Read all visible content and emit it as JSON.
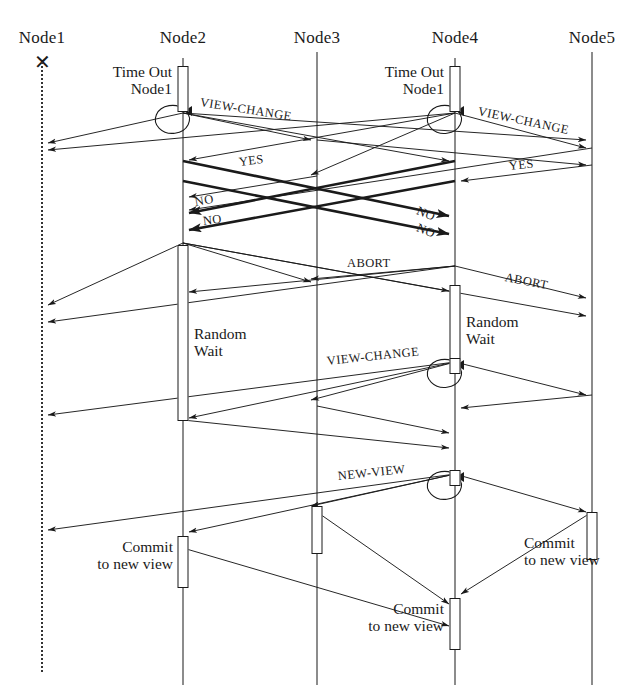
{
  "diagram": {
    "type": "sequence-diagram",
    "width": 625,
    "height": 696,
    "background": "#ffffff",
    "line_color": "#1a1a1a"
  },
  "nodes": [
    {
      "id": "n1",
      "label": "Node1",
      "x": 42,
      "label_y": 28,
      "lifeline_top": 62,
      "lifeline_bottom": 672,
      "state": "failed",
      "dead_marker": "x-mark",
      "dead_marker_y": 62
    },
    {
      "id": "n2",
      "label": "Node2",
      "x": 183,
      "label_y": 28,
      "lifeline_top": 58,
      "lifeline_bottom": 685,
      "state": "alive"
    },
    {
      "id": "n3",
      "label": "Node3",
      "x": 317,
      "label_y": 28,
      "lifeline_top": 52,
      "lifeline_bottom": 685,
      "state": "alive"
    },
    {
      "id": "n4",
      "label": "Node4",
      "x": 455,
      "label_y": 28,
      "lifeline_top": 58,
      "lifeline_bottom": 685,
      "state": "alive"
    },
    {
      "id": "n5",
      "label": "Node5",
      "x": 592,
      "label_y": 28,
      "lifeline_top": 52,
      "lifeline_bottom": 685,
      "state": "alive"
    }
  ],
  "activations": [
    {
      "node": "n2",
      "y": 66,
      "h": 46,
      "w": 11,
      "name": "timeout-box-node2"
    },
    {
      "node": "n4",
      "y": 66,
      "h": 46,
      "w": 11,
      "name": "timeout-box-node4"
    },
    {
      "node": "n2",
      "y": 245,
      "h": 176,
      "w": 11,
      "name": "random-wait-box-node2"
    },
    {
      "node": "n4",
      "y": 285,
      "h": 76,
      "w": 11,
      "name": "random-wait-box-node4"
    },
    {
      "node": "n4",
      "y": 358,
      "h": 16,
      "w": 11,
      "name": "view-change-box-node4"
    },
    {
      "node": "n4",
      "y": 470,
      "h": 16,
      "w": 11,
      "name": "new-view-box-node4"
    },
    {
      "node": "n3",
      "y": 506,
      "h": 48,
      "w": 11,
      "name": "commit-box-node3-upper"
    },
    {
      "node": "n5",
      "y": 512,
      "h": 48,
      "w": 11,
      "name": "commit-box-node5"
    },
    {
      "node": "n2",
      "y": 536,
      "h": 52,
      "w": 11,
      "name": "commit-box-node2"
    },
    {
      "node": "n4",
      "y": 598,
      "h": 52,
      "w": 11,
      "name": "commit-box-node4"
    }
  ],
  "notes": [
    {
      "text_line1": "Time Out",
      "text_line2": "Node1",
      "x": 172,
      "y": 63,
      "align": "right",
      "name": "note-timeout-node2"
    },
    {
      "text_line1": "Time Out",
      "text_line2": "Node1",
      "x": 444,
      "y": 63,
      "align": "right",
      "name": "note-timeout-node4"
    },
    {
      "text_line1": "Random",
      "text_line2": "Wait",
      "x": 194,
      "y": 325,
      "align": "left",
      "name": "note-random-wait-node2"
    },
    {
      "text_line1": "Random",
      "text_line2": "Wait",
      "x": 466,
      "y": 313,
      "align": "left",
      "name": "note-random-wait-node4"
    },
    {
      "text_line1": "Commit",
      "text_line2": "to new view",
      "x": 173,
      "y": 538,
      "align": "right",
      "name": "note-commit-node2"
    },
    {
      "text_line1": "Commit",
      "text_line2": "to new view",
      "x": 524,
      "y": 534,
      "align": "left",
      "name": "note-commit-node5"
    },
    {
      "text_line1": "Commit",
      "text_line2": "to new view",
      "x": 444,
      "y": 600,
      "align": "right",
      "name": "note-commit-node4"
    }
  ],
  "message_labels": [
    {
      "text": "VIEW-CHANGE",
      "x": 200,
      "y": 95,
      "rotate": 9,
      "size": "normal",
      "name": "label-view-change-1"
    },
    {
      "text": "VIEW-CHANGE",
      "x": 478,
      "y": 104,
      "rotate": 12,
      "size": "normal",
      "name": "label-view-change-2"
    },
    {
      "text": "YES",
      "x": 239,
      "y": 155,
      "rotate": -7,
      "size": "normal",
      "name": "label-yes-1"
    },
    {
      "text": "YES",
      "x": 509,
      "y": 159,
      "rotate": -6,
      "size": "normal",
      "name": "label-yes-2"
    },
    {
      "text": "NO",
      "x": 195,
      "y": 195,
      "rotate": -10,
      "size": "normal",
      "name": "label-no-1"
    },
    {
      "text": "NO",
      "x": 203,
      "y": 214,
      "rotate": -7,
      "size": "normal",
      "name": "label-no-2"
    },
    {
      "text": "NO",
      "x": 417,
      "y": 203,
      "rotate": 22,
      "size": "normal",
      "name": "label-no-3"
    },
    {
      "text": "NO",
      "x": 417,
      "y": 220,
      "rotate": 22,
      "size": "normal",
      "name": "label-no-4"
    },
    {
      "text": "ABORT",
      "x": 347,
      "y": 256,
      "rotate": 0,
      "size": "normal",
      "name": "label-abort-1"
    },
    {
      "text": "ABORT",
      "x": 505,
      "y": 270,
      "rotate": 11,
      "size": "normal",
      "name": "label-abort-2"
    },
    {
      "text": "VIEW-CHANGE",
      "x": 327,
      "y": 354,
      "rotate": -6,
      "size": "normal",
      "name": "label-view-change-3"
    },
    {
      "text": "NEW-VIEW",
      "x": 338,
      "y": 469,
      "rotate": -6,
      "size": "normal",
      "name": "label-new-view"
    }
  ],
  "self_loops": [
    {
      "x": 183,
      "y": 124,
      "rx": 17,
      "ry": 14,
      "name": "self-loop-node2-viewchange"
    },
    {
      "x": 455,
      "y": 124,
      "rx": 17,
      "ry": 14,
      "name": "self-loop-node4-viewchange"
    },
    {
      "x": 455,
      "y": 378,
      "rx": 17,
      "ry": 14,
      "name": "self-loop-node4-viewchange2"
    },
    {
      "x": 455,
      "y": 490,
      "rx": 17,
      "ry": 14,
      "name": "self-loop-node4-newview"
    }
  ],
  "arrows": [
    {
      "x1": 183,
      "y1": 113,
      "x2": 48,
      "y2": 143,
      "w": "thin",
      "name": "arrow-view-change-n2-n1"
    },
    {
      "x1": 183,
      "y1": 113,
      "x2": 311,
      "y2": 140,
      "w": "thin",
      "name": "arrow-view-change-n2-n3"
    },
    {
      "x1": 183,
      "y1": 113,
      "x2": 449,
      "y2": 161,
      "w": "thin",
      "name": "arrow-view-change-n2-n4"
    },
    {
      "x1": 183,
      "y1": 113,
      "x2": 586,
      "y2": 140,
      "w": "thin",
      "name": "arrow-view-change-n2-n5"
    },
    {
      "x1": 455,
      "y1": 113,
      "x2": 48,
      "y2": 150,
      "w": "thin",
      "name": "arrow-view-change-n4-n1"
    },
    {
      "x1": 455,
      "y1": 113,
      "x2": 189,
      "y2": 160,
      "w": "thin",
      "name": "arrow-view-change-n4-n2"
    },
    {
      "x1": 455,
      "y1": 113,
      "x2": 311,
      "y2": 175,
      "w": "thin",
      "name": "arrow-view-change-n4-n3"
    },
    {
      "x1": 455,
      "y1": 113,
      "x2": 586,
      "y2": 148,
      "w": "thin",
      "name": "arrow-view-change-n4-n5"
    },
    {
      "x1": 317,
      "y1": 176,
      "x2": 189,
      "y2": 197,
      "w": "thin",
      "name": "arrow-yes-n3-n2"
    },
    {
      "x1": 592,
      "y1": 148,
      "x2": 189,
      "y2": 210,
      "w": "thin",
      "name": "arrow-yes-n5-n2"
    },
    {
      "x1": 317,
      "y1": 140,
      "x2": 586,
      "y2": 165,
      "w": "thin",
      "name": "arrow-yes-n3-n5"
    },
    {
      "x1": 592,
      "y1": 165,
      "x2": 461,
      "y2": 181,
      "w": "thin",
      "name": "arrow-yes-n5-n4"
    },
    {
      "x1": 455,
      "y1": 161,
      "x2": 189,
      "y2": 213,
      "w": "bold",
      "name": "arrow-no-n4-n2"
    },
    {
      "x1": 455,
      "y1": 181,
      "x2": 189,
      "y2": 230,
      "w": "bold",
      "name": "arrow-no2-n4-n2"
    },
    {
      "x1": 183,
      "y1": 161,
      "x2": 449,
      "y2": 216,
      "w": "bold",
      "name": "arrow-no-n2-n4"
    },
    {
      "x1": 183,
      "y1": 181,
      "x2": 449,
      "y2": 234,
      "w": "bold",
      "name": "arrow-no2-n2-n4"
    },
    {
      "x1": 183,
      "y1": 243,
      "x2": 48,
      "y2": 305,
      "w": "thin",
      "name": "arrow-abort-n2-n1"
    },
    {
      "x1": 183,
      "y1": 243,
      "x2": 311,
      "y2": 282,
      "w": "thin",
      "name": "arrow-abort-n2-n3"
    },
    {
      "x1": 183,
      "y1": 243,
      "x2": 449,
      "y2": 291,
      "w": "thin",
      "name": "arrow-abort-n2-n4"
    },
    {
      "x1": 183,
      "y1": 243,
      "x2": 586,
      "y2": 316,
      "w": "thin",
      "name": "arrow-abort-n2-n5"
    },
    {
      "x1": 455,
      "y1": 266,
      "x2": 48,
      "y2": 322,
      "w": "thin",
      "name": "arrow-abort-n4-n1"
    },
    {
      "x1": 455,
      "y1": 266,
      "x2": 189,
      "y2": 292,
      "w": "thin",
      "name": "arrow-abort-n4-n2"
    },
    {
      "x1": 455,
      "y1": 266,
      "x2": 311,
      "y2": 279,
      "w": "thin",
      "name": "arrow-abort-n4-n3"
    },
    {
      "x1": 455,
      "y1": 266,
      "x2": 586,
      "y2": 298,
      "w": "thin",
      "name": "arrow-abort-n4-n5"
    },
    {
      "x1": 455,
      "y1": 362,
      "x2": 48,
      "y2": 415,
      "w": "thin",
      "name": "arrow-view-change3-n4-n1"
    },
    {
      "x1": 455,
      "y1": 362,
      "x2": 189,
      "y2": 418,
      "w": "thin",
      "name": "arrow-view-change3-n4-n2"
    },
    {
      "x1": 455,
      "y1": 362,
      "x2": 311,
      "y2": 400,
      "w": "thin",
      "name": "arrow-view-change3-n4-n3"
    },
    {
      "x1": 455,
      "y1": 362,
      "x2": 586,
      "y2": 395,
      "w": "thin",
      "name": "arrow-view-change3-n4-n5"
    },
    {
      "x1": 183,
      "y1": 420,
      "x2": 449,
      "y2": 448,
      "w": "thin",
      "name": "arrow-reply-n2-n4"
    },
    {
      "x1": 317,
      "y1": 406,
      "x2": 449,
      "y2": 433,
      "w": "thin",
      "name": "arrow-reply-n3-n4"
    },
    {
      "x1": 592,
      "y1": 395,
      "x2": 461,
      "y2": 408,
      "w": "thin",
      "name": "arrow-reply-n5-n4"
    },
    {
      "x1": 455,
      "y1": 474,
      "x2": 48,
      "y2": 530,
      "w": "thin",
      "name": "arrow-new-view-n4-n1"
    },
    {
      "x1": 455,
      "y1": 474,
      "x2": 189,
      "y2": 532,
      "w": "thin",
      "name": "arrow-new-view-n4-n2"
    },
    {
      "x1": 455,
      "y1": 474,
      "x2": 311,
      "y2": 506,
      "w": "thin",
      "name": "arrow-new-view-n4-n3"
    },
    {
      "x1": 455,
      "y1": 474,
      "x2": 586,
      "y2": 512,
      "w": "thin",
      "name": "arrow-new-view-n4-n5"
    },
    {
      "x1": 592,
      "y1": 512,
      "x2": 461,
      "y2": 594,
      "w": "thin",
      "name": "arrow-commit-n5-n4"
    },
    {
      "x1": 317,
      "y1": 512,
      "x2": 449,
      "y2": 604,
      "w": "thin",
      "name": "arrow-commit-n3-n4"
    },
    {
      "x1": 183,
      "y1": 548,
      "x2": 449,
      "y2": 626,
      "w": "thin",
      "name": "arrow-commit-n2-n4"
    }
  ]
}
